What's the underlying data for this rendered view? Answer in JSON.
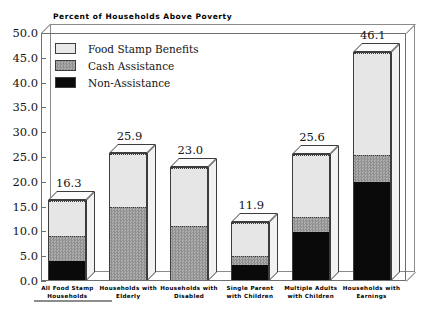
{
  "chart_data": {
    "type": "bar",
    "stacked": true,
    "title": "Percent of Households Above Poverty",
    "xlabel": "",
    "ylabel": "",
    "ylim": [
      0.0,
      50.0
    ],
    "ytick_step": 5.0,
    "grid": false,
    "legend_position": "top-left",
    "categories": [
      "All Food Stamp Households",
      "Households with Elderly",
      "Households with Disabled",
      "Single Parent with Children",
      "Multiple Adults with Children",
      "Households with Earnings"
    ],
    "category_lines": [
      [
        "All Food Stamp",
        "Households"
      ],
      [
        "Households with",
        "Elderly"
      ],
      [
        "Households with",
        "Disabled"
      ],
      [
        "Single Parent",
        "with Children"
      ],
      [
        "Multiple Adults",
        "with Children"
      ],
      [
        "Households with",
        "Earnings"
      ]
    ],
    "series": [
      {
        "name": "Non-Assistance",
        "values": [
          4.0,
          0.0,
          0.0,
          3.1,
          9.9,
          19.9
        ]
      },
      {
        "name": "Cash Assistance",
        "values": [
          5.0,
          14.9,
          11.0,
          2.0,
          3.1,
          5.6
        ]
      },
      {
        "name": "Food Stamp Benefits",
        "values": [
          7.3,
          11.0,
          12.0,
          6.8,
          12.6,
          20.6
        ]
      }
    ],
    "totals": [
      16.3,
      25.9,
      23.0,
      11.9,
      25.6,
      46.1
    ],
    "total_labels": [
      "16.3",
      "25.9",
      "23.0",
      "11.9",
      "25.6",
      "46.1"
    ],
    "ytick_labels": [
      "0.0",
      "5.0",
      "10.0",
      "15.0",
      "20.0",
      "25.0",
      "30.0",
      "35.0",
      "40.0",
      "45.0",
      "50.0"
    ],
    "colors": {
      "non_assistance": "#0a0a0a",
      "cash_assistance": "#9e9e9e",
      "food_stamp_benefits": "#e6e6e6",
      "axis": "#6e6e6e",
      "text": "#141414"
    }
  }
}
